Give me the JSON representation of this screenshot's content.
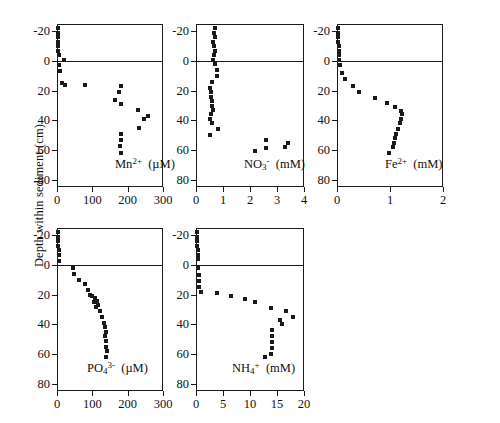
{
  "figure": {
    "y_axis_label": "Depth within sediment (cm)",
    "y_ticks": [
      -20,
      0,
      20,
      40,
      60,
      80
    ],
    "y_range": [
      -25,
      85
    ],
    "sediment_water_interface_depth": 0
  },
  "chart_data": [
    {
      "type": "scatter",
      "id": "mn",
      "title": "",
      "xlabel": "Mn2+ (µM)",
      "label_species": "Mn",
      "label_charge": "2+",
      "label_units": "(µM)",
      "ylabel": "Depth within sediment (cm)",
      "xlim": [
        0,
        300
      ],
      "ylim": [
        -25,
        85
      ],
      "xticks": [
        0,
        100,
        200,
        300
      ],
      "yticks": [
        -20,
        0,
        20,
        40,
        60,
        80
      ],
      "grid": false,
      "x": [
        2,
        3,
        3,
        4,
        3,
        4,
        5,
        20,
        6,
        8,
        14,
        22,
        80,
        180,
        175,
        165,
        182,
        230,
        258,
        247,
        232,
        182,
        180,
        178,
        180
      ],
      "y": [
        -22,
        -19,
        -16,
        -13,
        -10,
        -7,
        -4,
        -1,
        3,
        7,
        15,
        16,
        16,
        17,
        21,
        26,
        29,
        33,
        37,
        39,
        45,
        49,
        53,
        57,
        62
      ]
    },
    {
      "type": "scatter",
      "id": "no3",
      "title": "",
      "xlabel": "NO3- (mM)",
      "label_species": "NO",
      "label_sub": "3",
      "label_charge": "-",
      "label_units": "(mM)",
      "ylabel": "Depth within sediment (cm)",
      "xlim": [
        0,
        4
      ],
      "ylim": [
        -25,
        85
      ],
      "xticks": [
        0,
        1,
        2,
        3,
        4
      ],
      "yticks": [
        -20,
        0,
        20,
        40,
        60,
        80
      ],
      "grid": false,
      "x": [
        0.72,
        0.66,
        0.7,
        0.62,
        0.66,
        0.7,
        0.68,
        0.62,
        0.7,
        0.78,
        0.76,
        0.58,
        0.52,
        0.56,
        0.54,
        0.6,
        0.58,
        0.62,
        0.56,
        0.52,
        0.58,
        0.8,
        0.52,
        2.18,
        2.58,
        2.6,
        3.4,
        3.3
      ],
      "y": [
        -22,
        -19,
        -16,
        -13,
        -10,
        -7,
        -4,
        -1,
        2,
        6,
        10,
        14,
        18,
        21,
        24,
        27,
        30,
        33,
        36,
        39,
        42,
        46,
        50,
        61,
        53,
        59,
        55,
        58
      ]
    },
    {
      "type": "scatter",
      "id": "fe",
      "title": "",
      "xlabel": "Fe2+ (mM)",
      "label_species": "Fe",
      "label_charge": "2+",
      "label_units": "(mM)",
      "ylabel": "Depth within sediment (cm)",
      "xlim": [
        0,
        2
      ],
      "ylim": [
        -25,
        85
      ],
      "xticks": [
        0,
        1,
        2
      ],
      "yticks": [
        -20,
        0,
        20,
        40,
        60,
        80
      ],
      "grid": false,
      "x": [
        0.02,
        0.02,
        0.02,
        0.02,
        0.03,
        0.03,
        0.03,
        0.04,
        0.06,
        0.1,
        0.16,
        0.3,
        0.42,
        0.72,
        0.95,
        1.1,
        1.2,
        1.22,
        1.2,
        1.18,
        1.15,
        1.12,
        1.1,
        1.08,
        1.05,
        0.98
      ],
      "y": [
        -22,
        -19,
        -16,
        -13,
        -10,
        -7,
        -4,
        -1,
        3,
        8,
        12,
        17,
        21,
        25,
        28,
        31,
        34,
        36,
        39,
        42,
        46,
        49,
        52,
        55,
        58,
        62
      ]
    },
    {
      "type": "scatter",
      "id": "po4",
      "title": "",
      "xlabel": "PO43- (µM)",
      "label_species": "PO",
      "label_sub": "4",
      "label_charge": "3-",
      "label_units": "(µM)",
      "ylabel": "Depth within sediment (cm)",
      "xlim": [
        0,
        300
      ],
      "ylim": [
        -25,
        85
      ],
      "xticks": [
        0,
        100,
        200,
        300
      ],
      "yticks": [
        -20,
        0,
        20,
        40,
        60,
        80
      ],
      "grid": false,
      "x": [
        3,
        3,
        4,
        4,
        5,
        5,
        6,
        46,
        48,
        62,
        78,
        88,
        92,
        100,
        108,
        104,
        112,
        116,
        110,
        122,
        128,
        134,
        136,
        138,
        136,
        140,
        138,
        142,
        140
      ],
      "y": [
        -22,
        -19,
        -16,
        -13,
        -10,
        -7,
        -3,
        2,
        6,
        10,
        13,
        17,
        20,
        21,
        22,
        25,
        24,
        27,
        28,
        31,
        35,
        39,
        42,
        45,
        48,
        51,
        55,
        58,
        62
      ]
    },
    {
      "type": "scatter",
      "id": "nh4",
      "title": "",
      "xlabel": "NH4+ (mM)",
      "label_species": "NH",
      "label_sub": "4",
      "label_charge": "+",
      "label_units": "(mM)",
      "ylabel": "Depth within sediment (cm)",
      "xlim": [
        0,
        20
      ],
      "ylim": [
        -25,
        85
      ],
      "xticks": [
        0,
        5,
        10,
        15,
        20
      ],
      "yticks": [
        -20,
        0,
        20,
        40,
        60,
        80
      ],
      "grid": false,
      "x": [
        0.2,
        0.2,
        0.2,
        0.2,
        0.3,
        0.3,
        0.3,
        0.4,
        0.5,
        0.5,
        0.6,
        1.0,
        3.8,
        6.5,
        9.0,
        11.0,
        13.8,
        16.6,
        18.0,
        15.6,
        16.0,
        14.0,
        14.0,
        14.0,
        14.0,
        13.8,
        12.8
      ],
      "y": [
        -22,
        -19,
        -16,
        -13,
        -10,
        -7,
        -4,
        2,
        7,
        11,
        15,
        18,
        19,
        21,
        23,
        25,
        29,
        31,
        35,
        37,
        40,
        44,
        48,
        52,
        56,
        60,
        62
      ]
    }
  ]
}
